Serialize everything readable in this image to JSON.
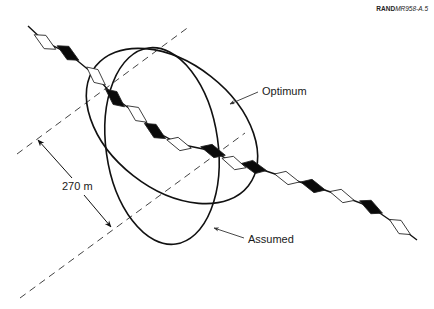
{
  "figure_id": {
    "prefix": "RAND",
    "suffix": "MR958-A.5"
  },
  "labels": {
    "optimum": "Optimum",
    "assumed": "Assumed",
    "distance": "270 m"
  },
  "track": {
    "points": [
      [
        28,
        26
      ],
      [
        45,
        42
      ],
      [
        68,
        53
      ],
      [
        96,
        76
      ],
      [
        115,
        98
      ],
      [
        137,
        114
      ],
      [
        155,
        131
      ],
      [
        179,
        144
      ],
      [
        213,
        151
      ],
      [
        234,
        163
      ],
      [
        254,
        167
      ],
      [
        287,
        178
      ],
      [
        313,
        186
      ],
      [
        342,
        196
      ],
      [
        371,
        207
      ],
      [
        400,
        227
      ],
      [
        417,
        240
      ]
    ],
    "markers": [
      {
        "x": 45,
        "y": 42,
        "fill": "white"
      },
      {
        "x": 68,
        "y": 53,
        "fill": "black"
      },
      {
        "x": 96,
        "y": 76,
        "fill": "white"
      },
      {
        "x": 115,
        "y": 98,
        "fill": "black"
      },
      {
        "x": 137,
        "y": 114,
        "fill": "white"
      },
      {
        "x": 155,
        "y": 131,
        "fill": "black"
      },
      {
        "x": 179,
        "y": 144,
        "fill": "white"
      },
      {
        "x": 213,
        "y": 151,
        "fill": "black"
      },
      {
        "x": 234,
        "y": 163,
        "fill": "white"
      },
      {
        "x": 254,
        "y": 167,
        "fill": "black"
      },
      {
        "x": 287,
        "y": 178,
        "fill": "white"
      },
      {
        "x": 313,
        "y": 186,
        "fill": "black"
      },
      {
        "x": 342,
        "y": 196,
        "fill": "white"
      },
      {
        "x": 371,
        "y": 207,
        "fill": "black"
      },
      {
        "x": 400,
        "y": 227,
        "fill": "white"
      }
    ]
  },
  "colors": {
    "line": "#111111",
    "dash": "#444444",
    "background": "#ffffff"
  }
}
